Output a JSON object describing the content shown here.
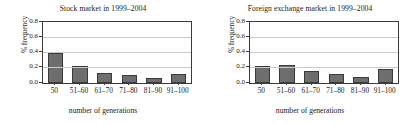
{
  "figure": {
    "background": "#ffffff",
    "bar_color": "#6e6e6e",
    "bar_edge_color": "#3a3a3a",
    "grid_color": "#c9c9c9",
    "axis_color": "#3b3b3b"
  },
  "panels": [
    {
      "id": "stock-market",
      "title": "Stock market in 1999–2004",
      "ylabel": "% frequency",
      "xlabel": "number of generations",
      "yticks": [
        "0.0",
        "0.2",
        "0.4",
        "0.6",
        "0.8"
      ],
      "xticks": [
        "50",
        "51–60",
        "61–70",
        "71–80",
        "81–90",
        "91–100"
      ]
    },
    {
      "id": "foreign-exchange-market",
      "title": "Foreign exchange market in 1999–2004",
      "ylabel": "% frequency",
      "xlabel": "number of generations",
      "yticks": [
        "0.0",
        "0.2",
        "0.4",
        "0.6",
        "0.8"
      ],
      "xticks": [
        "50",
        "51–60",
        "61–70",
        "71–80",
        "81–90",
        "91–100"
      ]
    }
  ],
  "chart_data": [
    {
      "type": "bar",
      "title": "Stock market in 1999–2004",
      "xlabel": "number of generations",
      "ylabel": "% frequency",
      "categories": [
        "50",
        "51–60",
        "61–70",
        "71–80",
        "81–90",
        "91–100"
      ],
      "values": [
        0.39,
        0.22,
        0.13,
        0.11,
        0.06,
        0.12
      ],
      "ylim": [
        0.0,
        0.8
      ],
      "ytick_values": [
        0.0,
        0.2,
        0.4,
        0.6,
        0.8
      ],
      "grid": "horizontal",
      "legend": "none"
    },
    {
      "type": "bar",
      "title": "Foreign exchange market in 1999–2004",
      "xlabel": "number of generations",
      "ylabel": "% frequency",
      "categories": [
        "50",
        "51–60",
        "61–70",
        "71–80",
        "81–90",
        "91–100"
      ],
      "values": [
        0.22,
        0.24,
        0.16,
        0.115,
        0.085,
        0.19
      ],
      "ylim": [
        0.0,
        0.8
      ],
      "ytick_values": [
        0.0,
        0.2,
        0.4,
        0.6,
        0.8
      ],
      "grid": "horizontal",
      "legend": "none"
    }
  ]
}
